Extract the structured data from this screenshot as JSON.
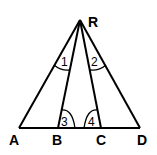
{
  "diagram": {
    "points": {
      "R": {
        "label": "R",
        "x": 80,
        "y": 20
      },
      "A": {
        "label": "A",
        "x": 19,
        "y": 128
      },
      "B": {
        "label": "B",
        "x": 58,
        "y": 128
      },
      "C": {
        "label": "C",
        "x": 101,
        "y": 128
      },
      "D": {
        "label": "D",
        "x": 140,
        "y": 128
      }
    },
    "angles": {
      "a1": {
        "label": "1"
      },
      "a2": {
        "label": "2"
      },
      "a3": {
        "label": "3"
      },
      "a4": {
        "label": "4"
      }
    },
    "stroke_color": "#000000",
    "background": "#ffffff"
  }
}
